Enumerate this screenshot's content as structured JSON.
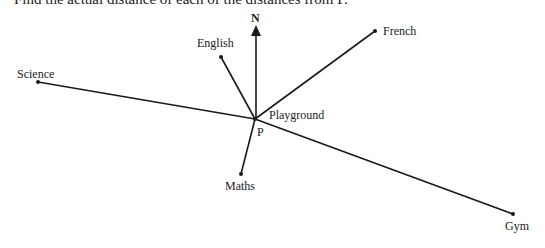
{
  "header": {
    "instruction_text": "Find the actual distance of each of the distances from P."
  },
  "diagram": {
    "north_label": "N",
    "center": {
      "label": "P",
      "name": "Playground",
      "x": 255,
      "y": 119
    },
    "north_arrow": {
      "x": 256,
      "y_top": 27
    },
    "locations": [
      {
        "name": "English",
        "x": 221,
        "y": 57
      },
      {
        "name": "French",
        "x": 375,
        "y": 31
      },
      {
        "name": "Science",
        "x": 38,
        "y": 82
      },
      {
        "name": "Maths",
        "x": 241,
        "y": 174
      },
      {
        "name": "Gym",
        "x": 513,
        "y": 214
      }
    ],
    "line_color": "#1a1a1a"
  }
}
